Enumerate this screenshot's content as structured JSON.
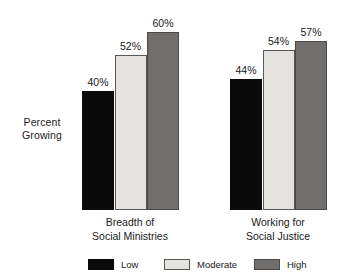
{
  "chart_data": {
    "type": "bar",
    "title": "",
    "subtitle": "",
    "xlabel": "",
    "ylabel": "Percent Growing",
    "ylabel_lines": [
      "Percent",
      "Growing"
    ],
    "ylim": [
      0,
      70
    ],
    "grid": false,
    "axis_visible": false,
    "value_label_suffix": "%",
    "legend_position": "bottom",
    "categories": [
      "Breadth of Social Ministries",
      "Working for Social Justice"
    ],
    "category_lines": [
      [
        "Breadth of",
        "Social Ministries"
      ],
      [
        "Working for",
        "Social Justice"
      ]
    ],
    "series": [
      {
        "name": "Low",
        "color": "#0a0a0a",
        "values": [
          40,
          52
        ],
        "labels": [
          "40%",
          "44%"
        ]
      },
      {
        "name": "Moderate",
        "color": "#e4e3e0",
        "values": [
          52,
          54
        ],
        "labels": [
          "52%",
          "54%"
        ]
      },
      {
        "name": "High",
        "color": "#706f6d",
        "values": [
          60,
          57
        ],
        "labels": [
          "60%",
          "57%"
        ]
      }
    ],
    "groups": [
      {
        "category_lines": [
          "Breadth of",
          "Social Ministries"
        ],
        "bars": [
          {
            "series": "Low",
            "value": 40,
            "label": "40%",
            "color": "#0a0a0a"
          },
          {
            "series": "Moderate",
            "value": 52,
            "label": "52%",
            "color": "#e4e3e0"
          },
          {
            "series": "High",
            "value": 60,
            "label": "60%",
            "color": "#706f6d"
          }
        ]
      },
      {
        "category_lines": [
          "Working for",
          "Social Justice"
        ],
        "bars": [
          {
            "series": "Low",
            "value": 44,
            "label": "44%",
            "color": "#0a0a0a"
          },
          {
            "series": "Moderate",
            "value": 54,
            "label": "54%",
            "color": "#e4e3e0"
          },
          {
            "series": "High",
            "value": 57,
            "label": "57%",
            "color": "#706f6d"
          }
        ]
      }
    ]
  },
  "legend": {
    "items": [
      {
        "label": "Low",
        "color": "#0a0a0a"
      },
      {
        "label": "Moderate",
        "color": "#e4e3e0"
      },
      {
        "label": "High",
        "color": "#706f6d"
      }
    ]
  },
  "colors": {
    "background": "#ffffff",
    "text": "#1a1a1a",
    "low": "#0a0a0a",
    "moderate": "#e4e3e0",
    "high": "#706f6d",
    "bar_border": "#2b2b2b"
  }
}
